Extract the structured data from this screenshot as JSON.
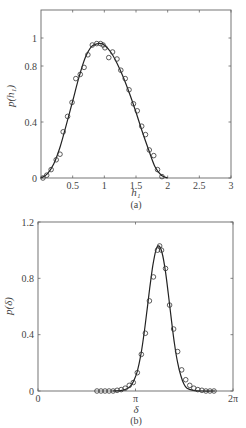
{
  "chart_data": [
    {
      "id": "a",
      "type": "line",
      "caption": "(a)",
      "xlabel": "h₁",
      "ylabel": "p(h₁)",
      "xlim": [
        0,
        3
      ],
      "ylim": [
        0,
        1.2
      ],
      "xticks": [
        {
          "v": 0.5,
          "label": "0.5"
        },
        {
          "v": 1,
          "label": "1"
        },
        {
          "v": 1.5,
          "label": "1.5"
        },
        {
          "v": 2,
          "label": "2"
        },
        {
          "v": 2.5,
          "label": "2.5"
        },
        {
          "v": 3,
          "label": "3"
        }
      ],
      "yticks": [
        {
          "v": 0,
          "label": "0"
        },
        {
          "v": 0.4,
          "label": "0.4"
        },
        {
          "v": 0.8,
          "label": "0.8"
        },
        {
          "v": 1,
          "label": "1"
        }
      ],
      "grid": false,
      "series": [
        {
          "name": "theory",
          "style": "line",
          "x": [
            0,
            0.1,
            0.2,
            0.3,
            0.4,
            0.5,
            0.6,
            0.7,
            0.8,
            0.9,
            0.95,
            1.0,
            1.1,
            1.2,
            1.3,
            1.4,
            1.5,
            1.6,
            1.7,
            1.8,
            1.9,
            2.0
          ],
          "y": [
            0,
            0.03,
            0.1,
            0.22,
            0.38,
            0.55,
            0.72,
            0.86,
            0.94,
            0.96,
            0.96,
            0.95,
            0.9,
            0.82,
            0.72,
            0.6,
            0.47,
            0.33,
            0.2,
            0.08,
            0.02,
            0
          ]
        },
        {
          "name": "simulation",
          "style": "circles",
          "x": [
            0.03,
            0.09,
            0.16,
            0.24,
            0.3,
            0.35,
            0.42,
            0.49,
            0.55,
            0.62,
            0.68,
            0.74,
            0.81,
            0.88,
            0.94,
            0.98,
            1.01,
            1.07,
            1.13,
            1.2,
            1.26,
            1.33,
            1.39,
            1.46,
            1.52,
            1.59,
            1.65,
            1.71,
            1.78,
            1.84,
            1.91
          ],
          "y": [
            0.0,
            0.02,
            0.06,
            0.13,
            0.17,
            0.33,
            0.44,
            0.54,
            0.71,
            0.74,
            0.79,
            0.88,
            0.95,
            0.96,
            0.96,
            0.95,
            0.93,
            0.86,
            0.9,
            0.85,
            0.77,
            0.71,
            0.63,
            0.53,
            0.48,
            0.37,
            0.31,
            0.2,
            0.16,
            0.06,
            0.01
          ]
        }
      ]
    },
    {
      "id": "b",
      "type": "line",
      "caption": "(b)",
      "xlabel": "δ",
      "ylabel": "p(δ)",
      "xlim": [
        0,
        6.2832
      ],
      "ylim": [
        0,
        1.2
      ],
      "xticks": [
        {
          "v": 0,
          "label": "0"
        },
        {
          "v": 3.1416,
          "label": "π"
        },
        {
          "v": 6.2832,
          "label": "2π"
        }
      ],
      "yticks": [
        {
          "v": 0,
          "label": "0"
        },
        {
          "v": 0.4,
          "label": "0.4"
        },
        {
          "v": 0.8,
          "label": "0.8"
        },
        {
          "v": 1.2,
          "label": "1.2"
        }
      ],
      "grid": false,
      "series": [
        {
          "name": "theory",
          "style": "line",
          "x": [
            2.4,
            2.7,
            2.9,
            3.0,
            3.1,
            3.2,
            3.3,
            3.4,
            3.5,
            3.6,
            3.7,
            3.8,
            3.89,
            4.0,
            4.1,
            4.2,
            4.3,
            4.4,
            4.5,
            4.6,
            4.7,
            4.8,
            5.0,
            5.3,
            5.7
          ],
          "y": [
            0.0,
            0.005,
            0.02,
            0.04,
            0.08,
            0.14,
            0.24,
            0.38,
            0.55,
            0.73,
            0.89,
            1.0,
            1.03,
            0.98,
            0.86,
            0.69,
            0.5,
            0.33,
            0.2,
            0.11,
            0.05,
            0.02,
            0.005,
            0.0,
            0.0
          ]
        },
        {
          "name": "simulation",
          "style": "circles",
          "x": [
            1.9,
            2.03,
            2.16,
            2.29,
            2.42,
            2.55,
            2.68,
            2.81,
            2.94,
            3.07,
            3.2,
            3.33,
            3.46,
            3.59,
            3.72,
            3.85,
            3.92,
            3.98,
            4.11,
            4.24,
            4.37,
            4.5,
            4.63,
            4.76,
            4.89,
            5.02,
            5.15,
            5.28,
            5.41,
            5.54,
            5.67
          ],
          "y": [
            0.0,
            0.0,
            0.0,
            0.0,
            0.0,
            0.005,
            0.01,
            0.02,
            0.04,
            0.06,
            0.13,
            0.26,
            0.41,
            0.64,
            0.81,
            1.0,
            1.03,
            1.0,
            0.87,
            0.61,
            0.44,
            0.28,
            0.15,
            0.08,
            0.04,
            0.02,
            0.01,
            0.005,
            0.0,
            0.0,
            0.0
          ]
        }
      ]
    }
  ]
}
